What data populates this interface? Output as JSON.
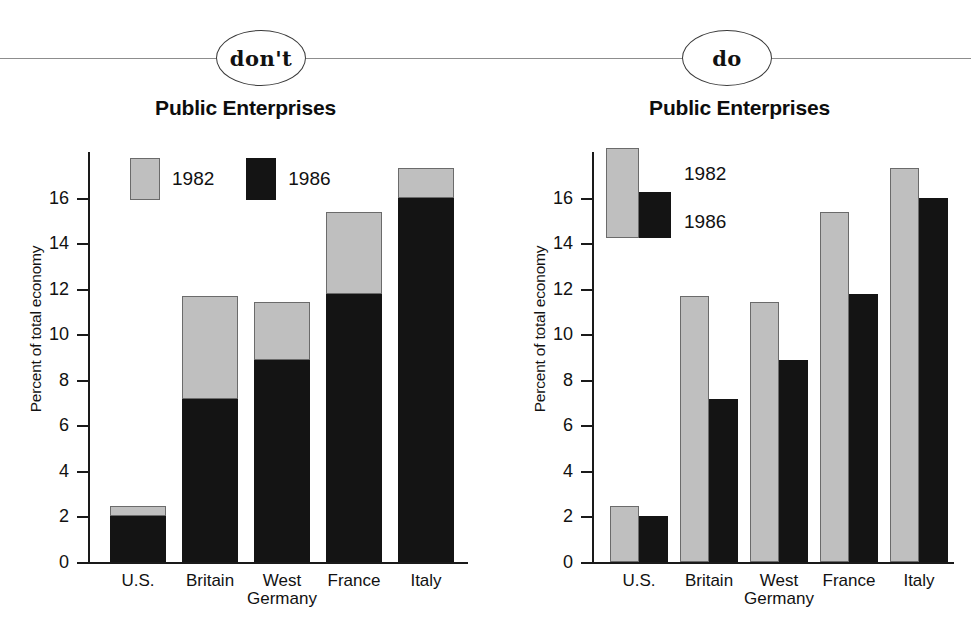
{
  "divider": {
    "dont_badge": "don't",
    "do_badge": "do",
    "line_color": "#8d8d8d"
  },
  "colors": {
    "series_1982": "#bfbfbf",
    "series_1986": "#141414",
    "axis": "#1a1a1a",
    "text": "#111111"
  },
  "panels": [
    {
      "key": "dont",
      "badge": "don't",
      "title": "Public Enterprises",
      "ylabel": "Percent of total economy",
      "legend": [
        "1982",
        "1986"
      ]
    },
    {
      "key": "do",
      "badge": "do",
      "title": "Public Enterprises",
      "ylabel": "Percent of total economy",
      "legend": [
        "1982",
        "1986"
      ]
    }
  ],
  "axis": {
    "ticks": [
      "0",
      "2",
      "4",
      "6",
      "8",
      "10",
      "12",
      "14",
      "16"
    ],
    "tick_values": [
      0,
      2,
      4,
      6,
      8,
      10,
      12,
      14,
      16
    ],
    "ymin": 0,
    "ymax": 18
  },
  "categories": [
    "U.S.",
    "Britain",
    "West\nGermany",
    "France",
    "Italy"
  ],
  "chart_data": [
    {
      "type": "bar",
      "id": "dont-stacked",
      "variant": "stacked",
      "title": "Public Enterprises",
      "badge": "don't",
      "xlabel": "",
      "ylabel": "Percent of total economy",
      "ylim": [
        0,
        18
      ],
      "yticks": [
        0,
        2,
        4,
        6,
        8,
        10,
        12,
        14,
        16
      ],
      "grid": false,
      "legend_position": "top-left-inside",
      "categories": [
        "U.S.",
        "Britain",
        "West Germany",
        "France",
        "Italy"
      ],
      "series": [
        {
          "name": "1986",
          "color": "#141414",
          "values": [
            2.0,
            7.15,
            8.85,
            11.75,
            16.0
          ]
        },
        {
          "name": "1982",
          "color": "#bfbfbf",
          "values": [
            2.45,
            11.7,
            11.4,
            15.35,
            17.3
          ]
        }
      ],
      "note": "Stacked rendering: gray segment drawn from the black value up to the 1982 total, so the stack top equals the 1982 value."
    },
    {
      "type": "bar",
      "id": "do-grouped",
      "variant": "grouped",
      "title": "Public Enterprises",
      "badge": "do",
      "xlabel": "",
      "ylabel": "Percent of total economy",
      "ylim": [
        0,
        18
      ],
      "yticks": [
        0,
        2,
        4,
        6,
        8,
        10,
        12,
        14,
        16
      ],
      "grid": false,
      "legend_position": "top-left-inside",
      "categories": [
        "U.S.",
        "Britain",
        "West Germany",
        "France",
        "Italy"
      ],
      "series": [
        {
          "name": "1982",
          "color": "#bfbfbf",
          "values": [
            2.45,
            11.7,
            11.4,
            15.35,
            17.3
          ]
        },
        {
          "name": "1986",
          "color": "#141414",
          "values": [
            2.0,
            7.15,
            8.85,
            11.75,
            16.0
          ]
        }
      ]
    }
  ]
}
